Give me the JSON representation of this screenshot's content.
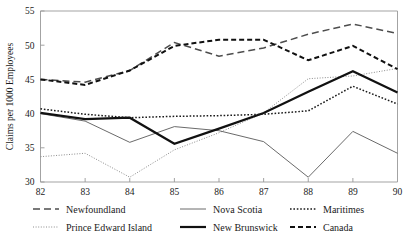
{
  "chart_data": {
    "type": "line",
    "title": "",
    "xlabel": "",
    "ylabel": "Claims per 1000 Employees",
    "x": [
      82,
      83,
      84,
      85,
      86,
      87,
      88,
      89,
      90
    ],
    "xticklabels": [
      "82",
      "83",
      "84",
      "85",
      "86",
      "87",
      "88",
      "89",
      "90"
    ],
    "yticklabels": [
      "30",
      "35",
      "40",
      "45",
      "50",
      "55"
    ],
    "yticks": [
      30,
      35,
      40,
      45,
      50,
      55
    ],
    "xlim": [
      82,
      90
    ],
    "ylim": [
      30,
      55
    ],
    "grid": false,
    "legend_position": "below",
    "series": [
      {
        "name": "Newfoundland",
        "style": "long-dash",
        "color": "#4d4d4d",
        "width": 1.5,
        "dash": "7,4",
        "values": [
          45.0,
          44.6,
          46.3,
          50.4,
          48.4,
          49.6,
          51.6,
          53.1,
          51.7
        ]
      },
      {
        "name": "Prince Edward Island",
        "style": "fine-dotted",
        "color": "#8c8c8c",
        "width": 1.0,
        "dash": "1,1.6",
        "values": [
          33.7,
          34.2,
          30.7,
          34.7,
          37.2,
          40.1,
          45.1,
          45.5,
          46.6
        ]
      },
      {
        "name": "Nova Scotia",
        "style": "thin-solid",
        "color": "#595959",
        "width": 0.9,
        "dash": "none",
        "values": [
          40.0,
          38.9,
          35.8,
          38.1,
          37.5,
          35.9,
          30.7,
          37.4,
          34.2
        ]
      },
      {
        "name": "New Brunswick",
        "style": "thick-solid",
        "color": "#111111",
        "width": 2.2,
        "dash": "none",
        "values": [
          40.1,
          39.2,
          39.4,
          35.6,
          37.8,
          40.1,
          43.2,
          46.2,
          43.1
        ]
      },
      {
        "name": "Maritimes",
        "style": "dotted",
        "color": "#1a1a1a",
        "width": 1.5,
        "dash": "1.6,1.8",
        "values": [
          40.7,
          39.9,
          39.4,
          39.6,
          39.7,
          39.9,
          40.4,
          44.0,
          41.4
        ]
      },
      {
        "name": "Canada",
        "style": "thick-dash",
        "color": "#111111",
        "width": 2.0,
        "dash": "5,3",
        "values": [
          45.0,
          44.2,
          46.3,
          49.9,
          50.8,
          50.8,
          47.8,
          49.9,
          46.5
        ]
      }
    ]
  },
  "legend": {
    "entries": [
      {
        "label": "Newfoundland",
        "series_index": 0
      },
      {
        "label": "Nova Scotia",
        "series_index": 2
      },
      {
        "label": "Maritimes",
        "series_index": 4
      },
      {
        "label": "Prince Edward Island",
        "series_index": 1
      },
      {
        "label": "New Brunswick",
        "series_index": 3
      },
      {
        "label": "Canada",
        "series_index": 5
      }
    ]
  }
}
